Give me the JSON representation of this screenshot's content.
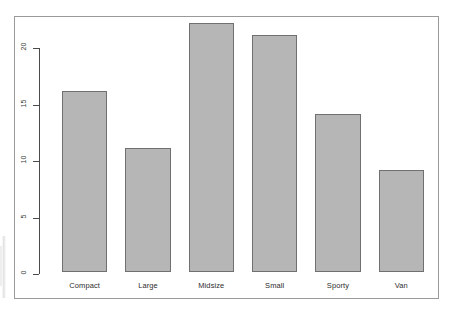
{
  "chart_data": {
    "type": "bar",
    "title": "",
    "subtitle": "",
    "xlabel": "",
    "ylabel": "",
    "categories": [
      "Compact",
      "Large",
      "Midsize",
      "Small",
      "Sporty",
      "Van"
    ],
    "values": [
      16,
      11,
      22,
      21,
      14,
      9
    ],
    "ylim": [
      0,
      22
    ],
    "yticks": [
      0,
      5,
      10,
      15,
      20
    ],
    "ytick_labels": [
      "0",
      "5",
      "10",
      "15",
      "20"
    ],
    "grid": false,
    "legend": null,
    "bar_fill_color": "#b6b6b6",
    "bar_border_color": "#707070",
    "axis_color": "#4a4a4a",
    "frame_color": "#9a9a9a",
    "background_color": "#ffffff"
  }
}
